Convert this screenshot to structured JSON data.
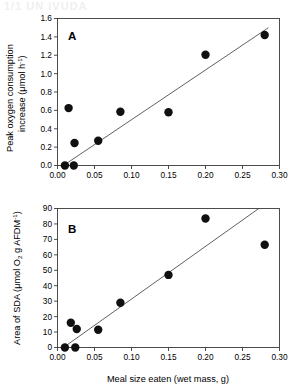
{
  "figure": {
    "ghost_header": "1/1  UN IVUDA",
    "x_axis_label": "Meal size eaten (wet mass, g)",
    "x_ticks": [
      "0.00",
      "0.05",
      "0.10",
      "0.15",
      "0.20",
      "0.25",
      "0.30"
    ],
    "x_tick_values": [
      0.0,
      0.05,
      0.1,
      0.15,
      0.2,
      0.25,
      0.3
    ],
    "panel_a_label": "A",
    "panel_b_label": "B",
    "panel_a_ylabel_line1": "Peak oxygen consumption",
    "panel_a_ylabel_line2_pre": "increase (",
    "panel_a_ylabel_line2_mu": "μmol h",
    "panel_a_ylabel_line2_sup": "-1",
    "panel_a_ylabel_line2_post": ")",
    "panel_a_yticks": [
      "0.0",
      "0.2",
      "0.4",
      "0.6",
      "0.8",
      "1.0",
      "1.2",
      "1.4",
      "1.6"
    ],
    "panel_a_ytick_values": [
      0.0,
      0.2,
      0.4,
      0.6,
      0.8,
      1.0,
      1.2,
      1.4,
      1.6
    ],
    "panel_b_ylabel_pre": "Area of SDA (",
    "panel_b_ylabel_mu": "μmol O",
    "panel_b_ylabel_sub": "2",
    "panel_b_ylabel_mid": " g AFDM",
    "panel_b_ylabel_sup": "-1",
    "panel_b_ylabel_post": ")",
    "panel_b_yticks": [
      "0",
      "10",
      "20",
      "30",
      "40",
      "50",
      "60",
      "70",
      "80",
      "90"
    ],
    "panel_b_ytick_values": [
      0,
      10,
      20,
      30,
      40,
      50,
      60,
      70,
      80,
      90
    ],
    "marker_color": "#101010",
    "line_color": "#444444",
    "frame_color": "#3a3a3a"
  },
  "chart_data": [
    {
      "type": "scatter",
      "panel": "A",
      "title": "A",
      "xlabel": "Meal size eaten (wet mass, g)",
      "ylabel": "Peak oxygen consumption increase (μmol h-1)",
      "xlim": [
        0.0,
        0.3
      ],
      "ylim": [
        0.0,
        1.6
      ],
      "grid": false,
      "legend": "none",
      "x": [
        0.01,
        0.015,
        0.022,
        0.023,
        0.055,
        0.085,
        0.15,
        0.2,
        0.28
      ],
      "y": [
        0.0,
        0.625,
        0.0,
        0.245,
        0.27,
        0.585,
        0.58,
        1.205,
        1.42
      ],
      "points": [
        {
          "x": 0.01,
          "y": 0.0
        },
        {
          "x": 0.015,
          "y": 0.625
        },
        {
          "x": 0.022,
          "y": 0.0
        },
        {
          "x": 0.023,
          "y": 0.245
        },
        {
          "x": 0.055,
          "y": 0.27
        },
        {
          "x": 0.085,
          "y": 0.585
        },
        {
          "x": 0.15,
          "y": 0.58
        },
        {
          "x": 0.2,
          "y": 1.205
        },
        {
          "x": 0.28,
          "y": 1.42
        }
      ],
      "fit_line": {
        "x0": 0.008,
        "y0": 0.0,
        "x1": 0.285,
        "y1": 1.5
      }
    },
    {
      "type": "scatter",
      "panel": "B",
      "title": "B",
      "xlabel": "Meal size eaten (wet mass, g)",
      "ylabel": "Area of SDA (μmol O2 g AFDM-1)",
      "xlim": [
        0.0,
        0.3
      ],
      "ylim": [
        0,
        90
      ],
      "grid": false,
      "legend": "none",
      "x": [
        0.01,
        0.018,
        0.024,
        0.026,
        0.055,
        0.085,
        0.15,
        0.2,
        0.28
      ],
      "y": [
        0.0,
        16.0,
        0.0,
        12.0,
        11.5,
        29.0,
        47.0,
        83.5,
        66.5
      ],
      "points": [
        {
          "x": 0.01,
          "y": 0.0
        },
        {
          "x": 0.018,
          "y": 16.0
        },
        {
          "x": 0.024,
          "y": 0.0
        },
        {
          "x": 0.026,
          "y": 12.0
        },
        {
          "x": 0.055,
          "y": 11.5
        },
        {
          "x": 0.085,
          "y": 29.0
        },
        {
          "x": 0.15,
          "y": 47.0
        },
        {
          "x": 0.2,
          "y": 83.5
        },
        {
          "x": 0.28,
          "y": 66.5
        }
      ],
      "fit_line": {
        "x0": 0.008,
        "y0": 0.0,
        "x1": 0.272,
        "y1": 90.0
      }
    }
  ]
}
